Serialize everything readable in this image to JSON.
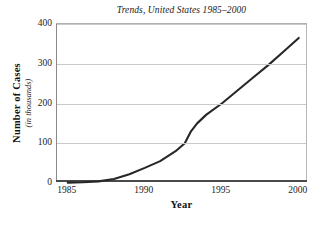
{
  "chart_data": {
    "type": "line",
    "title": "Trends, United States 1985–2000",
    "xlabel": "Year",
    "ylabel": "Number of Cases",
    "ylabel_sub": "(in thousands)",
    "xlim": [
      1984.3,
      2000.6
    ],
    "ylim": [
      0,
      400
    ],
    "grid": true,
    "legend": false,
    "xticks": [
      1985,
      1990,
      1995,
      2000
    ],
    "xtick_labels": [
      "1985",
      "1990",
      "1995",
      "2000"
    ],
    "yticks": [
      0,
      100,
      200,
      300,
      400
    ],
    "ytick_labels": [
      "0",
      "100",
      "200",
      "300",
      "400"
    ],
    "series": [
      {
        "name": "Number of Cases",
        "color": "#272727",
        "x": [
          1985,
          1986,
          1987,
          1988,
          1989,
          1990,
          1991,
          1992,
          1992.6,
          1993,
          1993.4,
          1994,
          1995,
          1996,
          1997,
          1998,
          1999,
          2000
        ],
        "values": [
          1,
          2,
          4,
          10,
          22,
          38,
          55,
          80,
          100,
          130,
          150,
          172,
          200,
          232,
          264,
          296,
          330,
          365
        ]
      }
    ]
  },
  "colors": {
    "line": "#272727",
    "grid": "#c9c9c9",
    "frame": "#b8b8b8",
    "axis": "#4a4a4a",
    "text": "#1b1b1b"
  }
}
